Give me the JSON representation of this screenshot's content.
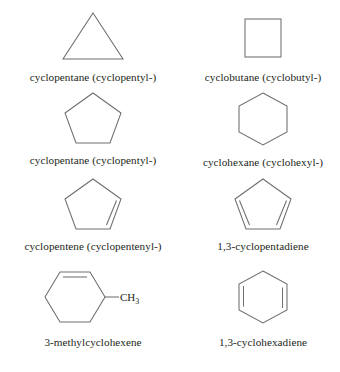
{
  "figure": {
    "background_color": "#ffffff",
    "bond_color": "#6e6e72",
    "text_color": "#231f20",
    "columns": 2,
    "rows": 4
  },
  "items": [
    {
      "id": "cyclopentane-triangle",
      "caption": "cyclopentane (cyclopentyl-)",
      "shape": "triangle",
      "ring_size": 3,
      "double_bonds": 0,
      "substituent": ""
    },
    {
      "id": "cyclobutane",
      "caption": "cyclobutane (cyclobutyl-)",
      "shape": "square",
      "ring_size": 4,
      "double_bonds": 0,
      "substituent": ""
    },
    {
      "id": "cyclopentane-pentagon",
      "caption": "cyclopentane (cyclopentyl-)",
      "shape": "pentagon",
      "ring_size": 5,
      "double_bonds": 0,
      "substituent": ""
    },
    {
      "id": "cyclohexane",
      "caption": "cyclohexane (cyclohexyl-)",
      "shape": "hexagon-pointy-top",
      "ring_size": 6,
      "double_bonds": 0,
      "substituent": ""
    },
    {
      "id": "cyclopentene",
      "caption": "cyclopentene (cyclopentenyl-)",
      "shape": "pentagon",
      "ring_size": 5,
      "double_bonds": 1,
      "substituent": ""
    },
    {
      "id": "cyclopentadiene",
      "caption": "1,3-cyclopentadiene",
      "shape": "pentagon",
      "ring_size": 5,
      "double_bonds": 2,
      "substituent": ""
    },
    {
      "id": "methylcyclohexene",
      "caption": "3-methylcyclohexene",
      "shape": "hexagon-flat-top",
      "ring_size": 6,
      "double_bonds": 1,
      "substituent": "CH3",
      "substituent_text": "CH",
      "substituent_subscript": "3"
    },
    {
      "id": "cyclohexadiene",
      "caption": "1,3-cyclohexadiene",
      "shape": "hexagon-pointy-top",
      "ring_size": 6,
      "double_bonds": 2,
      "substituent": ""
    }
  ]
}
